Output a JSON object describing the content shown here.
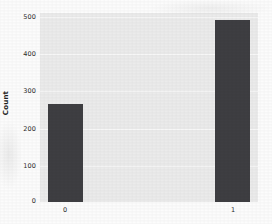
{
  "chart_data": {
    "type": "bar",
    "title": "",
    "subtitle": "",
    "xlabel": "",
    "ylabel": "Count",
    "categories": [
      "0",
      "1"
    ],
    "values": [
      265,
      492
    ],
    "series": [
      {
        "name": "Count",
        "values": [
          265,
          492
        ]
      }
    ],
    "ylim": [
      0,
      500
    ],
    "yticks": [
      0,
      100,
      200,
      300,
      400,
      500
    ],
    "ytick_labels": [
      "0",
      "100",
      "200",
      "300",
      "400",
      "500"
    ],
    "xtick_labels": [
      "0",
      "1"
    ],
    "grid": true,
    "grid_axis": "y",
    "legend": false,
    "legend_position": "none",
    "bar_color": "#3e3e42",
    "plot_background": "#ebebeb",
    "figure_background": "#fcfcfc",
    "gridline_color": "#f7f7f7",
    "tick_label_color": "#2b2b2b"
  }
}
